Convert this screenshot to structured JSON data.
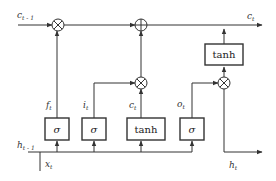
{
  "diagram": {
    "colors": {
      "stroke": "#333333",
      "background": "#ffffff"
    },
    "labels": {
      "c_prev": {
        "base": "c",
        "sub": "t - 1"
      },
      "c_out": {
        "base": "c",
        "sub": "t"
      },
      "h_prev": {
        "base": "h",
        "sub": "t - 1"
      },
      "x_in": {
        "base": "x",
        "sub": "t"
      },
      "h_out": {
        "base": "h",
        "sub": "t"
      },
      "f_gate": {
        "base": "f",
        "sub": "t"
      },
      "i_gate": {
        "base": "i",
        "sub": "t"
      },
      "c_cand": {
        "base": "c",
        "sub": "t"
      },
      "o_gate": {
        "base": "o",
        "sub": "t"
      }
    },
    "boxes": {
      "forget_sigma": "σ",
      "input_sigma": "σ",
      "candidate_tanh": "tanh",
      "output_sigma": "σ",
      "cell_tanh": "tanh"
    },
    "operators": {
      "forget_mult": "multiply",
      "cell_add": "add",
      "input_mult": "multiply",
      "output_mult": "multiply"
    }
  }
}
